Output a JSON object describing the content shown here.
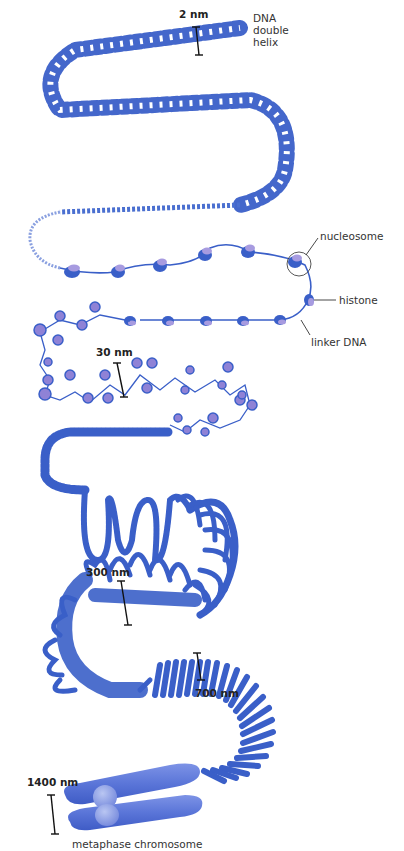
{
  "diagram": {
    "colors": {
      "dna_blue": "#3a5fc8",
      "dna_dark": "#2e4fb5",
      "histone_lilac": "#9b8fdb",
      "chromosome_blue": "#5673d6",
      "centromere": "#8ea2e6",
      "text": "#333333"
    },
    "labels": {
      "dna_double_helix_line1": "DNA",
      "dna_double_helix_line2": "double",
      "dna_double_helix_line3": "helix",
      "nucleosome": "nucleosome",
      "histone": "histone",
      "linker_dna": "linker DNA",
      "metaphase_chromosome": "metaphase chromosome"
    },
    "scale_bars": {
      "helix": "2 nm",
      "fiber30": "30 nm",
      "loops300": "300 nm",
      "coil700": "700 nm",
      "chromosome1400": "1400 nm"
    },
    "stages": [
      {
        "name": "DNA double helix",
        "width": "2 nm"
      },
      {
        "name": "beads on a string (nucleosomes)",
        "width": "11 nm"
      },
      {
        "name": "30 nm fiber",
        "width": "30 nm"
      },
      {
        "name": "looped domains",
        "width": "300 nm"
      },
      {
        "name": "condensed coil",
        "width": "700 nm"
      },
      {
        "name": "metaphase chromosome",
        "width": "1400 nm"
      }
    ]
  }
}
